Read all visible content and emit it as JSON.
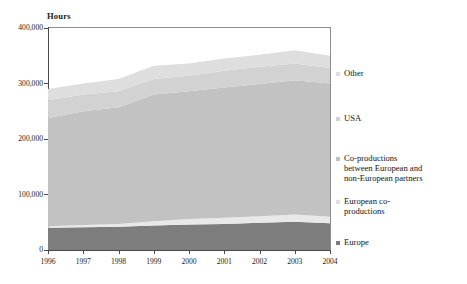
{
  "chart_data": {
    "type": "area",
    "stacked": true,
    "title": "",
    "subtitle": "",
    "xlabel": "",
    "ylabel": "Hours",
    "axis_title_y": "Hours",
    "categories": [
      "1996",
      "1997",
      "1998",
      "1999",
      "2000",
      "2001",
      "2002",
      "2003",
      "2004"
    ],
    "x": [
      1996,
      1997,
      1998,
      1999,
      2000,
      2001,
      2002,
      2003,
      2004
    ],
    "ylim": [
      0,
      400000
    ],
    "yticks": [
      0,
      100000,
      200000,
      300000,
      400000
    ],
    "ytick_labels": [
      "0",
      "100,000",
      "200,000",
      "300,000",
      "400,000"
    ],
    "xtick_labels": [
      "1996",
      "1997",
      "1998",
      "1999",
      "2000",
      "2001",
      "2002",
      "2003",
      "2004"
    ],
    "grid": false,
    "legend_position": "right",
    "series": [
      {
        "name": "Europe",
        "color": "#7d7d7d",
        "values": [
          40000,
          41000,
          42000,
          44000,
          46000,
          47000,
          49000,
          51000,
          48000
        ]
      },
      {
        "name": "European co-productions",
        "color": "#e8e8e8",
        "values": [
          3000,
          4000,
          5000,
          8000,
          10000,
          11000,
          12000,
          13000,
          12000
        ]
      },
      {
        "name": "Co-productions between European and non-European partners",
        "color": "#c2c2c2",
        "values": [
          195000,
          205000,
          210000,
          228000,
          230000,
          235000,
          238000,
          242000,
          240000
        ]
      },
      {
        "name": "USA",
        "color": "#d2d2d2",
        "values": [
          32000,
          30000,
          29000,
          28000,
          28000,
          30000,
          31000,
          30000,
          28000
        ]
      },
      {
        "name": "Other",
        "color": "#dedede",
        "values": [
          20000,
          20000,
          22000,
          24000,
          22000,
          22000,
          22000,
          24000,
          22000
        ]
      }
    ],
    "totals": [
      290000,
      300000,
      308000,
      332000,
      336000,
      345000,
      352000,
      360000,
      350000
    ]
  },
  "legend": {
    "items": [
      {
        "label": "Other",
        "color": "#dedede"
      },
      {
        "label": "USA",
        "color": "#d2d2d2"
      },
      {
        "label": "Co-productions\nbetween European and\nnon-European partners",
        "color": "#c2c2c2"
      },
      {
        "label": "European co-\nproductions",
        "color": "#e0e0e0"
      },
      {
        "label": "Europe",
        "color": "#7d7d7d"
      }
    ]
  },
  "axes": {
    "y_title": "Hours",
    "y_labels": [
      "400,000",
      "300,000",
      "200,000",
      "100,000",
      "0"
    ],
    "x_labels": [
      "1996",
      "1997",
      "1998",
      "1999",
      "2000",
      "2001",
      "2002",
      "2003",
      "2004"
    ]
  },
  "caption": {
    "text": ""
  }
}
